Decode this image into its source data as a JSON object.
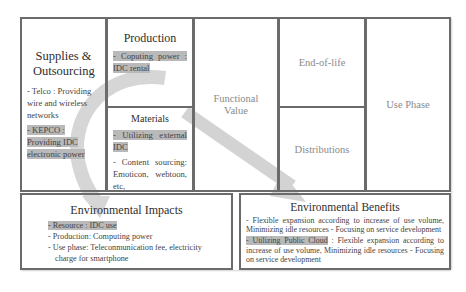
{
  "diagram": {
    "top_row": {
      "supplies": {
        "title": "Supplies & Outsourcing",
        "items": [
          {
            "text": "- Telco : Providing wire and wireless networks",
            "highlighted": false
          },
          {
            "text": "- KEPCO : Providing IDC electronic power",
            "highlighted": true
          }
        ]
      },
      "production": {
        "title": "Production",
        "items": [
          {
            "text": "- Coputing power : IDC rental",
            "highlighted": true
          }
        ]
      },
      "materials": {
        "title": "Materials",
        "items": [
          {
            "text": "- Utilizing external IDC",
            "highlighted": true
          },
          {
            "text": "- Content sourcing: Emoticon, webtoon, etc,",
            "highlighted": false
          }
        ]
      },
      "functional_value": {
        "title": "Functional Value"
      },
      "end_of_life": {
        "title": "End-of-life"
      },
      "distributions": {
        "title": "Distributions"
      },
      "use_phase": {
        "title": "Use Phase"
      }
    },
    "bottom_row": {
      "impacts": {
        "title": "Environmental Impacts",
        "items": [
          {
            "text": "- Resource : IDC use",
            "highlighted": true
          },
          {
            "text": "- Production: Computing power",
            "highlighted": false
          },
          {
            "text": "- Use phase: Teleconmunication fee, electricity charge for smartphone",
            "highlighted": false
          }
        ]
      },
      "benefits": {
        "title": "Environmental Benefits",
        "item1": "- Flexible expansion according to increase of use volume, Minimizing idle resources - Focusing on service development",
        "item2_highlight": "- Utilizing Public Cloud",
        "item2_rest": ": Flexible expansion according to increase of use volume, Minimizing idle resources - Focusing on service development"
      }
    },
    "colors": {
      "border": "#6b6b6b",
      "highlight": "#b9b9b9",
      "arrow": "#d3d3d3"
    }
  }
}
